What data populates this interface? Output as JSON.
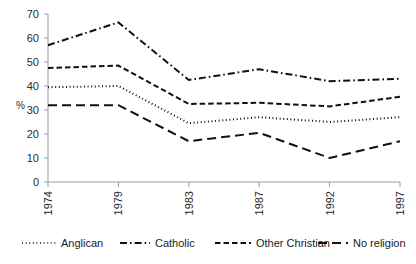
{
  "chart_data": {
    "type": "line",
    "title": "",
    "xlabel": "",
    "ylabel": "%",
    "categories": [
      "1974",
      "1979",
      "1983",
      "1987",
      "1992",
      "1997"
    ],
    "x": [
      1974,
      1979,
      1983,
      1987,
      1992,
      1997
    ],
    "ylim": [
      0,
      70
    ],
    "yticks": [
      0,
      10,
      20,
      30,
      40,
      50,
      60,
      70
    ],
    "ytick_labels": [
      "0",
      "10",
      "20",
      "30",
      "40",
      "50",
      "60",
      "70"
    ],
    "grid": false,
    "legend_position": "bottom",
    "series": [
      {
        "name": "Anglican",
        "dash": "dotted",
        "color": "#111111",
        "values": [
          39.5,
          40.0,
          24.5,
          27.0,
          25.0,
          27.0
        ]
      },
      {
        "name": "Catholic",
        "dash": "dash-dot",
        "color": "#111111",
        "values": [
          57.0,
          66.5,
          42.5,
          47.0,
          42.0,
          43.0
        ]
      },
      {
        "name": "Other Christian",
        "dash": "short-dash",
        "color": "#111111",
        "values": [
          47.5,
          48.5,
          32.5,
          33.0,
          31.5,
          35.5
        ]
      },
      {
        "name": "No religion",
        "dash": "long-dash",
        "color": "#111111",
        "values": [
          32.0,
          32.0,
          17.0,
          20.5,
          10.0,
          17.0
        ]
      }
    ]
  },
  "legend": {
    "items": [
      {
        "label": "Anglican",
        "dash": "dotted"
      },
      {
        "label": "Catholic",
        "dash": "dash-dot"
      },
      {
        "label": "Other Christian",
        "dash": "short-dash"
      },
      {
        "label": "No religion",
        "dash": "long-dash"
      }
    ]
  },
  "axes": {
    "y_axis_title": "%"
  }
}
